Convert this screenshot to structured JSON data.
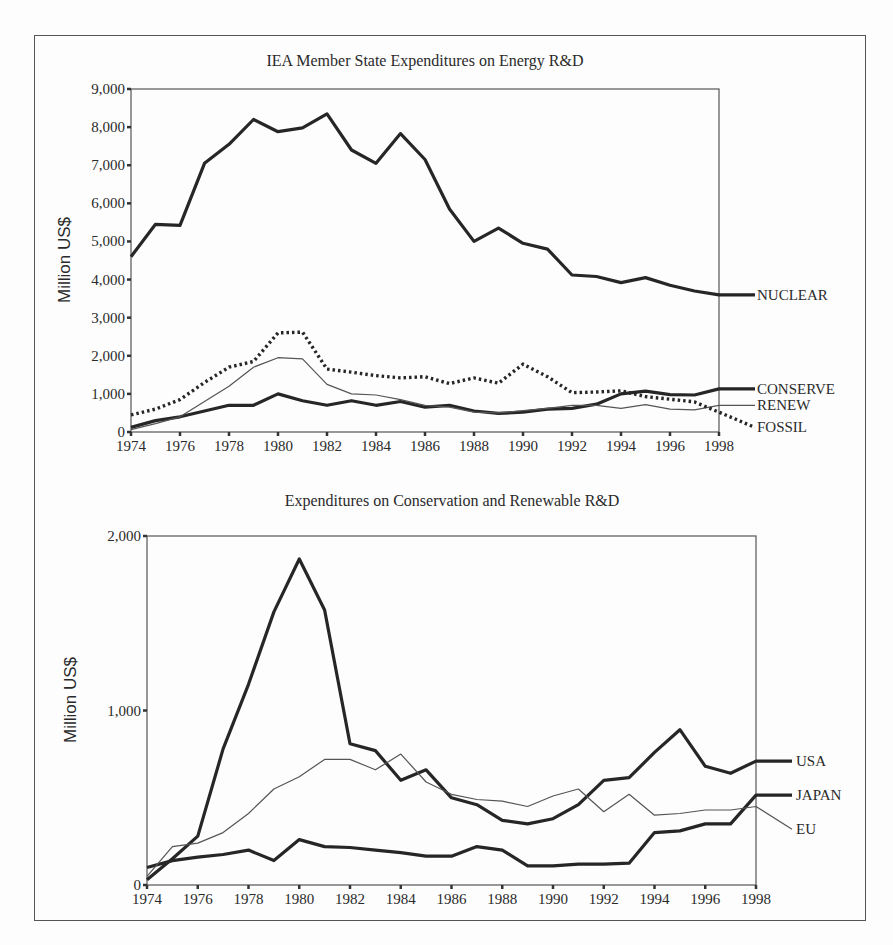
{
  "chart_data": [
    {
      "type": "line",
      "title": "IEA Member State Expenditures on Energy R&D",
      "xlabel": "",
      "ylabel": "Million US$",
      "ylim": [
        0,
        9000
      ],
      "xlim": [
        1974,
        1998
      ],
      "x": [
        1974,
        1975,
        1976,
        1977,
        1978,
        1979,
        1980,
        1981,
        1982,
        1983,
        1984,
        1985,
        1986,
        1987,
        1988,
        1989,
        1990,
        1991,
        1992,
        1993,
        1994,
        1995,
        1996,
        1997,
        1998
      ],
      "yticks": [
        "0",
        "1,000",
        "2,000",
        "3,000",
        "4,000",
        "5,000",
        "6,000",
        "7,000",
        "8,000",
        "9,000"
      ],
      "xticks": [
        "1974",
        "1976",
        "1978",
        "1980",
        "1982",
        "1984",
        "1986",
        "1988",
        "1990",
        "1992",
        "1994",
        "1996",
        "1998"
      ],
      "grid": false,
      "legend_position": "right, inline labels",
      "series": [
        {
          "name": "NUCLEAR",
          "style": "thick",
          "values": [
            4600,
            5450,
            5420,
            7050,
            7550,
            8200,
            7880,
            7980,
            8350,
            7400,
            7050,
            7830,
            7150,
            5850,
            5000,
            5350,
            4950,
            4800,
            4120,
            4080,
            3920,
            4050,
            3850,
            3700,
            3600
          ],
          "label_value": 3600
        },
        {
          "name": "CONSERVE",
          "style": "thick",
          "values": [
            120,
            300,
            400,
            550,
            700,
            700,
            1000,
            820,
            700,
            820,
            700,
            800,
            650,
            700,
            550,
            490,
            520,
            600,
            620,
            730,
            1000,
            1070,
            980,
            970,
            1130
          ],
          "label_value": 1130
        },
        {
          "name": "RENEW",
          "style": "thin",
          "values": [
            60,
            220,
            400,
            800,
            1200,
            1700,
            1950,
            1920,
            1250,
            1000,
            970,
            850,
            700,
            650,
            520,
            500,
            560,
            620,
            700,
            700,
            620,
            720,
            600,
            580,
            700
          ],
          "label_value": 700
        },
        {
          "name": "FOSSIL",
          "style": "dotted",
          "values": [
            450,
            600,
            850,
            1300,
            1700,
            1850,
            2600,
            2620,
            1650,
            1570,
            1480,
            1420,
            1450,
            1270,
            1420,
            1280,
            1780,
            1450,
            1030,
            1050,
            1080,
            930,
            860,
            790,
            520
          ],
          "label_value": 120
        }
      ]
    },
    {
      "type": "line",
      "title": "Expenditures on Conservation and Renewable R&D",
      "xlabel": "",
      "ylabel": "Million US$",
      "ylim": [
        0,
        2000
      ],
      "xlim": [
        1974,
        1998
      ],
      "x": [
        1974,
        1975,
        1976,
        1977,
        1978,
        1979,
        1980,
        1981,
        1982,
        1983,
        1984,
        1985,
        1986,
        1987,
        1988,
        1989,
        1990,
        1991,
        1992,
        1993,
        1994,
        1995,
        1996,
        1997,
        1998
      ],
      "yticks": [
        "0",
        "1,000",
        "2,000"
      ],
      "xticks": [
        "1974",
        "1976",
        "1978",
        "1980",
        "1982",
        "1984",
        "1986",
        "1988",
        "1990",
        "1992",
        "1994",
        "1996",
        "1998"
      ],
      "grid": false,
      "legend_position": "right, inline labels",
      "series": [
        {
          "name": "USA",
          "style": "thick",
          "values": [
            30,
            150,
            280,
            780,
            1150,
            1565,
            1868,
            1576,
            810,
            770,
            600,
            660,
            500,
            460,
            370,
            350,
            380,
            460,
            600,
            615,
            760,
            890,
            680,
            640,
            710
          ],
          "label_value": 710
        },
        {
          "name": "JAPAN",
          "style": "thick",
          "values": [
            100,
            140,
            160,
            175,
            200,
            140,
            260,
            220,
            215,
            200,
            185,
            165,
            165,
            220,
            200,
            110,
            110,
            120,
            120,
            125,
            300,
            310,
            350,
            350,
            515
          ],
          "label_value": 515
        },
        {
          "name": "EU",
          "style": "thin",
          "values": [
            50,
            220,
            240,
            300,
            410,
            550,
            620,
            720,
            720,
            660,
            750,
            590,
            520,
            490,
            480,
            450,
            510,
            550,
            420,
            520,
            400,
            410,
            430,
            430,
            450
          ],
          "label_value": 320
        }
      ]
    }
  ]
}
